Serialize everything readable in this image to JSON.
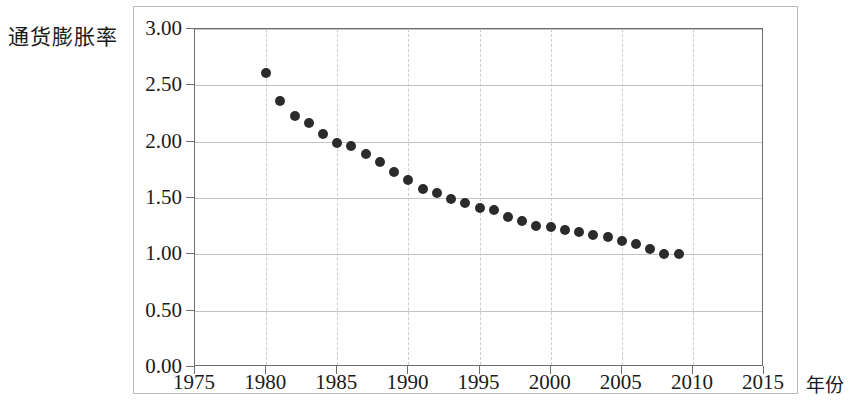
{
  "figure": {
    "y_axis_title": "通货膨胀率",
    "x_axis_title": "年份"
  },
  "chart_data": {
    "type": "scatter",
    "title": "",
    "xlabel": "年份",
    "ylabel": "通货膨胀率",
    "xlim": [
      1975,
      2015
    ],
    "ylim": [
      0.0,
      3.0
    ],
    "grid": true,
    "legend": "none",
    "xticks": [
      "1975",
      "1980",
      "1985",
      "1990",
      "1995",
      "2000",
      "2005",
      "2010",
      "2015"
    ],
    "xtick_values": [
      1975,
      1980,
      1985,
      1990,
      1995,
      2000,
      2005,
      2010,
      2015
    ],
    "yticks": [
      "0.00",
      "0.50",
      "1.00",
      "1.50",
      "2.00",
      "2.50",
      "3.00"
    ],
    "ytick_values": [
      0.0,
      0.5,
      1.0,
      1.5,
      2.0,
      2.5,
      3.0
    ],
    "marker": "filled-circle",
    "marker_color": "#2b2b2b",
    "x": [
      1980,
      1981,
      1982,
      1983,
      1984,
      1985,
      1986,
      1987,
      1988,
      1989,
      1990,
      1991,
      1992,
      1993,
      1994,
      1995,
      1996,
      1997,
      1998,
      1999,
      2000,
      2001,
      2002,
      2003,
      2004,
      2005,
      2006,
      2007,
      2008,
      2009
    ],
    "values": [
      2.61,
      2.36,
      2.23,
      2.17,
      2.07,
      1.99,
      1.96,
      1.89,
      1.82,
      1.73,
      1.66,
      1.58,
      1.54,
      1.49,
      1.46,
      1.41,
      1.39,
      1.33,
      1.3,
      1.25,
      1.24,
      1.22,
      1.2,
      1.17,
      1.15,
      1.12,
      1.09,
      1.05,
      1.0,
      1.0
    ]
  }
}
